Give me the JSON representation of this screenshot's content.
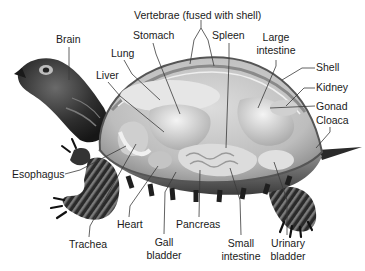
{
  "diagram": {
    "labels": {
      "vertebrae": "Vertebrae (fused with shell)",
      "brain": "Brain",
      "stomach": "Stomach",
      "spleen": "Spleen",
      "large_intestine_1": "Large",
      "large_intestine_2": "intestine",
      "lung": "Lung",
      "liver": "Liver",
      "shell": "Shell",
      "kidney": "Kidney",
      "gonad": "Gonad",
      "cloaca": "Cloaca",
      "esophagus": "Esophagus",
      "heart": "Heart",
      "pancreas": "Pancreas",
      "trachea": "Trachea",
      "gall_bladder_1": "Gall",
      "gall_bladder_2": "bladder",
      "small_intestine_1": "Small",
      "small_intestine_2": "intestine",
      "urinary_bladder_1": "Urinary",
      "urinary_bladder_2": "bladder"
    },
    "colors": {
      "background": "#ffffff",
      "label_text": "#1a1a1a",
      "leader_line": "#3a3a3a",
      "skin_dark": "#2b2b2b",
      "shell_glass": "#c9c9c9",
      "organ_light": "#e4e4e4"
    }
  }
}
